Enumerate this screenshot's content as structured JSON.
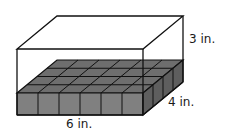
{
  "figure": {
    "labels": {
      "height": "3 in.",
      "depth": "4 in.",
      "length": "6 in."
    },
    "base_layer": {
      "rows": 4,
      "columns": 6,
      "cube_count": 24
    },
    "colors": {
      "cube_top": "#6e6e6e",
      "cube_front": "#808080",
      "cube_side": "#5e5e5e",
      "edge": "#111111"
    }
  }
}
